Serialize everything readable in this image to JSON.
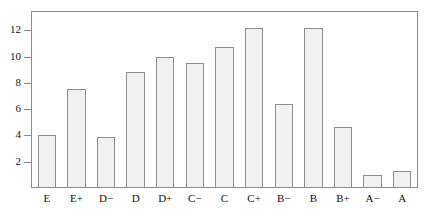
{
  "chart_data": {
    "type": "bar",
    "title": "",
    "subtitle": "",
    "xlabel": "",
    "ylabel": "",
    "categories": [
      "E",
      "E+",
      "D−",
      "D",
      "D+",
      "C−",
      "C",
      "C+",
      "B−",
      "B",
      "B+",
      "A−",
      "A"
    ],
    "values": [
      4.0,
      7.55,
      3.85,
      8.8,
      10.0,
      9.5,
      10.75,
      12.2,
      6.4,
      12.2,
      4.65,
      1.0,
      1.3
    ],
    "ylim": [
      0,
      13.4
    ],
    "yticks": [
      2,
      4,
      6,
      8,
      10,
      12
    ],
    "ytick_labels": [
      "2",
      "4",
      "6",
      "8",
      "10",
      "12"
    ],
    "xlim": [
      0,
      13
    ],
    "grid": false,
    "legend": null,
    "annotations": [],
    "colors": {
      "bar_fill": "#f1f1ef",
      "bar_border": "#8d8d8d",
      "frame": "#8a8a8a",
      "text": "#15120f",
      "background": "#ffffff"
    }
  }
}
